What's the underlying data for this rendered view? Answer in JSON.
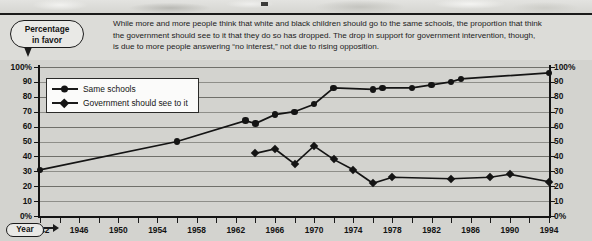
{
  "callout": {
    "line1": "Percentage",
    "line2": "in favor"
  },
  "caption": {
    "line1": "While more and more people think that white and black children should go to the same schools, the proportion that think",
    "line2": "the government should see to it that they do so has dropped. The drop in support for government intervention, though,",
    "line3": "is due to more people answering “no interest,” not due to rising opposition."
  },
  "axis_label": {
    "year": "Year"
  },
  "legend": {
    "items": [
      {
        "label": "Same schools",
        "marker": "circle"
      },
      {
        "label": "Government should see to it",
        "marker": "diamond"
      }
    ]
  },
  "chart_data": {
    "type": "line",
    "title": "",
    "xlabel": "Year",
    "ylabel": "Percentage in favor",
    "xlim": [
      1942,
      1994
    ],
    "ylim": [
      0,
      100
    ],
    "grid": true,
    "legend_position": "top-left",
    "ytick_labels": [
      "0%",
      "10",
      "20",
      "30",
      "40",
      "50",
      "60",
      "70",
      "80",
      "90",
      "100%"
    ],
    "ytick_values": [
      0,
      10,
      20,
      30,
      40,
      50,
      60,
      70,
      80,
      90,
      100
    ],
    "xtick_labels": [
      "1942",
      "1946",
      "1950",
      "1954",
      "1958",
      "1962",
      "1966",
      "1970",
      "1974",
      "1978",
      "1982",
      "1986",
      "1990",
      "1994"
    ],
    "xtick_values": [
      1942,
      1946,
      1950,
      1954,
      1958,
      1962,
      1966,
      1970,
      1974,
      1978,
      1982,
      1986,
      1990,
      1994
    ],
    "xtick_minor_step": 2,
    "series": [
      {
        "name": "Same schools",
        "marker": "circle",
        "color": "#141414",
        "points": [
          {
            "x": 1942,
            "y": 31
          },
          {
            "x": 1956,
            "y": 50
          },
          {
            "x": 1963,
            "y": 64
          },
          {
            "x": 1964,
            "y": 62
          },
          {
            "x": 1966,
            "y": 68
          },
          {
            "x": 1968,
            "y": 70
          },
          {
            "x": 1970,
            "y": 75
          },
          {
            "x": 1972,
            "y": 86
          },
          {
            "x": 1976,
            "y": 85
          },
          {
            "x": 1977,
            "y": 86
          },
          {
            "x": 1980,
            "y": 86
          },
          {
            "x": 1982,
            "y": 88
          },
          {
            "x": 1984,
            "y": 90
          },
          {
            "x": 1985,
            "y": 92
          },
          {
            "x": 1994,
            "y": 96
          }
        ]
      },
      {
        "name": "Government should see to it",
        "marker": "diamond",
        "color": "#141414",
        "points": [
          {
            "x": 1964,
            "y": 42
          },
          {
            "x": 1966,
            "y": 45
          },
          {
            "x": 1968,
            "y": 35
          },
          {
            "x": 1970,
            "y": 47
          },
          {
            "x": 1972,
            "y": 38
          },
          {
            "x": 1974,
            "y": 31
          },
          {
            "x": 1976,
            "y": 22
          },
          {
            "x": 1978,
            "y": 26
          },
          {
            "x": 1984,
            "y": 25
          },
          {
            "x": 1988,
            "y": 26
          },
          {
            "x": 1990,
            "y": 28
          },
          {
            "x": 1994,
            "y": 23
          }
        ]
      }
    ]
  }
}
